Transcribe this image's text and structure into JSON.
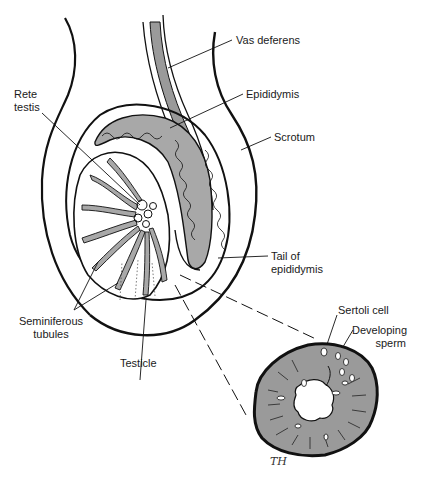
{
  "diagram": {
    "labels": {
      "vas_deferens": "Vas deferens",
      "epididymis": "Epididymis",
      "scrotum": "Scrotum",
      "rete_testis": "Rete\ntestis",
      "tail_of_epididymis": "Tail of\nepididymis",
      "seminiferous_tubules": "Seminiferous\ntubules",
      "testicle": "Testicle",
      "sertoli_cell": "Sertoli cell",
      "developing_sperm": "Developing\nsperm"
    },
    "signature": "TH",
    "colors": {
      "line": "#111111",
      "fill_gray": "#9a9a9a",
      "tubule_fill": "#a8a8a8",
      "background": "#ffffff"
    }
  }
}
